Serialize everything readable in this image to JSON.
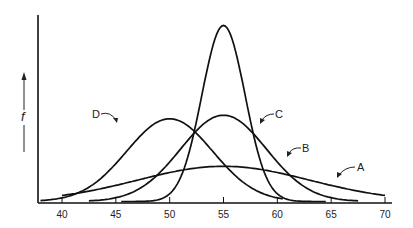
{
  "chart_data": {
    "type": "line",
    "title": "",
    "xlabel": "",
    "ylabel": "f",
    "xlim": [
      38,
      71
    ],
    "x_ticks": [
      40,
      45,
      50,
      55,
      60,
      65,
      70
    ],
    "grid": false,
    "legend": "inline labels",
    "series": [
      {
        "name": "A",
        "distribution": "normal",
        "mean": 55,
        "sd": 8,
        "x_range": [
          40,
          70
        ],
        "relative_peak": 0.2
      },
      {
        "name": "B",
        "distribution": "normal",
        "mean": 55,
        "sd": 4,
        "x_range": [
          42.5,
          67.5
        ],
        "relative_peak": 0.49
      },
      {
        "name": "C",
        "distribution": "normal",
        "mean": 55,
        "sd": 2,
        "x_range": [
          45.5,
          64.5
        ],
        "relative_peak": 1.0
      },
      {
        "name": "D",
        "distribution": "normal",
        "mean": 50,
        "sd": 4,
        "x_range": [
          38,
          60.5
        ],
        "relative_peak": 0.47
      }
    ],
    "annotations": [
      "A",
      "B",
      "C",
      "D"
    ]
  },
  "labels": {
    "ylabel": "f",
    "A": "A",
    "B": "B",
    "C": "C",
    "D": "D"
  }
}
